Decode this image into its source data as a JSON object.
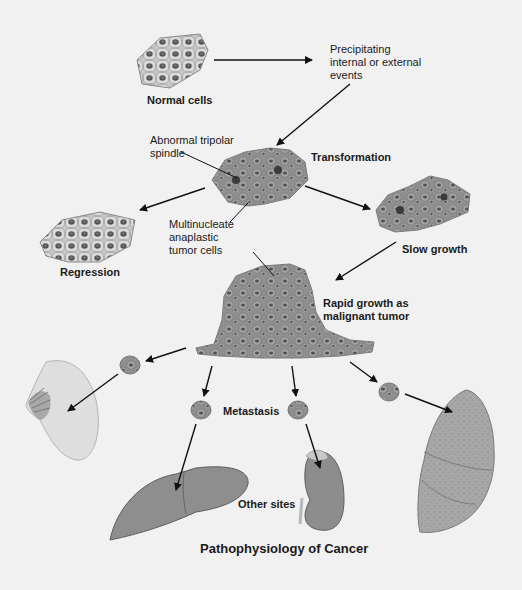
{
  "diagram": {
    "title": "Pathophysiology of Cancer",
    "nodes": {
      "normal_cells": "Normal cells",
      "precipitating": [
        "Precipitating",
        "internal or external",
        "events"
      ],
      "abnormal_spindle": [
        "Abnormal tripolar",
        "spindle"
      ],
      "transformation": "Transformation",
      "multinucleate": [
        "Multinucleate",
        "anaplastic",
        "tumor cells"
      ],
      "regression": "Regression",
      "slow_growth": "Slow growth",
      "rapid_growth": [
        "Rapid growth as",
        "malignant tumor"
      ],
      "metastasis": "Metastasis",
      "other_sites": "Other sites"
    },
    "organs": [
      "breast",
      "liver",
      "kidney",
      "lung"
    ],
    "colors": {
      "background": "#f1f1f1",
      "cell_fill": "#9a9a9a",
      "nucleus": "#4a4a4a",
      "normal_cell": "#d6d6d6",
      "organ": "#8c8c8c",
      "arrow": "#111111"
    }
  }
}
